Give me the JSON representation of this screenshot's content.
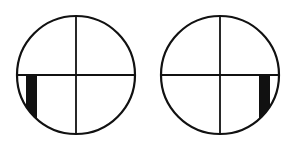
{
  "diagram": {
    "colors": {
      "stroke": "#111111",
      "fill": "#111111",
      "background": "#ffffff"
    },
    "circles": [
      {
        "name": "left",
        "cx": 76,
        "cy": 75,
        "r": 59,
        "bar": {
          "x": 26,
          "y": 75,
          "w": 11,
          "h": 46,
          "position": "lower-left"
        }
      },
      {
        "name": "right",
        "cx": 220,
        "cy": 75,
        "r": 59,
        "bar": {
          "x": 259,
          "y": 75,
          "w": 11,
          "h": 44,
          "position": "lower-right"
        }
      }
    ]
  }
}
